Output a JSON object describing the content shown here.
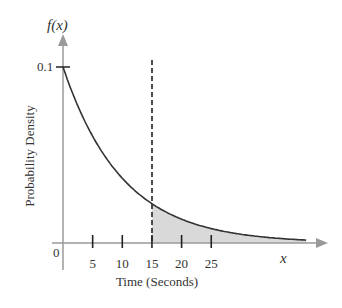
{
  "chart_data": {
    "type": "area",
    "title": "",
    "function": "f(x) = 0.1 * exp(-0.1 x)",
    "xlabel": "Time (Seconds)",
    "ylabel": "Probability Density",
    "x_axis_variable": "x",
    "y_axis_variable": "f(x)",
    "x_ticks": [
      5,
      10,
      15,
      20,
      25
    ],
    "x_tick_labels": [
      "5",
      "10",
      "15",
      "20",
      "25"
    ],
    "origin_label": "0",
    "y_ticks": [
      0.1
    ],
    "y_tick_labels": [
      "0.1"
    ],
    "xlim": [
      0,
      42
    ],
    "ylim": [
      0,
      0.1
    ],
    "dashed_line_x": 15,
    "shaded_region": {
      "from": 15,
      "to": 41,
      "description": "Area under curve for x >= 15"
    },
    "x": [
      0,
      5,
      10,
      15,
      20,
      25,
      30,
      35,
      40
    ],
    "values": [
      0.1,
      0.0607,
      0.0368,
      0.0223,
      0.0135,
      0.0082,
      0.005,
      0.003,
      0.0018
    ],
    "grid": false,
    "legend": null,
    "colors": {
      "curve": "#333333",
      "axes": "#9a9a9a",
      "shade": "#d9d9d9",
      "dashed": "#222222"
    }
  },
  "labels": {
    "fx": "f(x)",
    "x": "x",
    "origin": "0",
    "y_tick": "0.1",
    "xlabel": "Time (Seconds)",
    "ylabel": "Probability Density",
    "ticks": [
      "5",
      "10",
      "15",
      "20",
      "25"
    ]
  }
}
